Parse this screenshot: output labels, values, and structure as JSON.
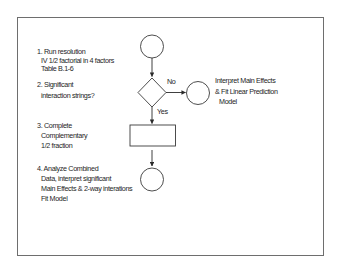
{
  "diagram": {
    "type": "flowchart",
    "colors": {
      "stroke": "#3a3a3a",
      "frame": "#6e6e6e",
      "text": "#1e1e1e",
      "background": "#ffffff"
    },
    "steps": [
      {
        "id": "step1",
        "number": "1.",
        "lines": [
          "1. Run resolution",
          "IV 1/2 factorial in 4 factors",
          "Table B.1-6"
        ],
        "shape": "circle"
      },
      {
        "id": "step2",
        "lines": [
          "2. Significant",
          "interaction strings?"
        ],
        "shape": "diamond"
      },
      {
        "id": "step3",
        "lines": [
          "3. Complete",
          "Complementary",
          "1/2 fraction"
        ],
        "shape": "rectangle"
      },
      {
        "id": "step4",
        "lines": [
          "4. Analyze Combined",
          "Data, interpret significant",
          "Main Effects & 2-way interations",
          "Fit Model"
        ],
        "shape": "circle"
      }
    ],
    "branch_no": {
      "edge_label": "No",
      "lines": [
        "Interpret Main Effects",
        "& Fit Linear Prediction",
        "Model"
      ],
      "shape": "circle"
    },
    "branch_yes": {
      "edge_label": "Yes"
    }
  }
}
